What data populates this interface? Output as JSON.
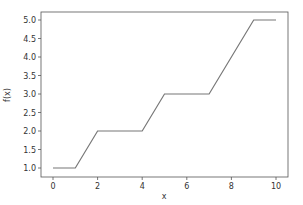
{
  "chart_data": {
    "type": "line",
    "title": "",
    "xlabel": "x",
    "ylabel": "f(x)",
    "xlim": [
      -0.5,
      10.5
    ],
    "ylim": [
      0.8,
      5.2
    ],
    "grid": false,
    "legend": null,
    "x_ticks": [
      0,
      2,
      4,
      6,
      8,
      10
    ],
    "x_tick_labels": [
      "0",
      "2",
      "4",
      "6",
      "8",
      "10"
    ],
    "y_ticks": [
      1.0,
      1.5,
      2.0,
      2.5,
      3.0,
      3.5,
      4.0,
      4.5,
      5.0
    ],
    "y_tick_labels": [
      "1.0",
      "1.5",
      "2.0",
      "2.5",
      "3.0",
      "3.5",
      "4.0",
      "4.5",
      "5.0"
    ],
    "series": [
      {
        "name": "f(x)",
        "color": "#777777",
        "x": [
          0,
          1,
          2,
          4,
          5,
          7,
          9,
          10
        ],
        "y": [
          1,
          1,
          2,
          2,
          3,
          3,
          5,
          5
        ]
      }
    ]
  }
}
